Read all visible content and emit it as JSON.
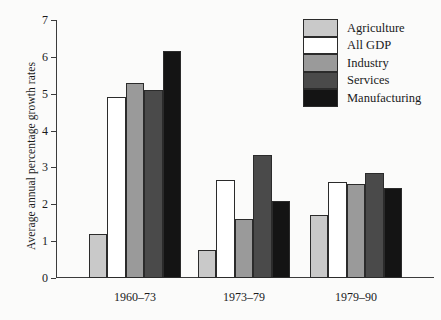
{
  "chart_data": {
    "type": "bar",
    "title": "",
    "xlabel": "",
    "ylabel": "Average annual percentage growth rates",
    "categories": [
      "1960–73",
      "1973–79",
      "1979–90"
    ],
    "ylim": [
      0,
      7
    ],
    "yticks": [
      0,
      1,
      2,
      3,
      4,
      5,
      6,
      7
    ],
    "ytick_labels": [
      "0",
      "1",
      "2",
      "3",
      "4",
      "5",
      "6",
      "7"
    ],
    "grid": false,
    "legend_position": "top-right",
    "series": [
      {
        "name": "Agriculture",
        "color": "#c9c9c9",
        "values": [
          1.2,
          0.75,
          1.7
        ]
      },
      {
        "name": "All GDP",
        "color": "#ffffff",
        "values": [
          4.9,
          2.65,
          2.6
        ]
      },
      {
        "name": "Industry",
        "color": "#9a9a9a",
        "values": [
          5.3,
          1.6,
          2.55
        ]
      },
      {
        "name": "Services",
        "color": "#4a4a4a",
        "values": [
          5.1,
          3.35,
          2.85
        ]
      },
      {
        "name": "Manufacturing",
        "color": "#141414",
        "values": [
          6.15,
          2.1,
          2.45
        ]
      }
    ]
  }
}
